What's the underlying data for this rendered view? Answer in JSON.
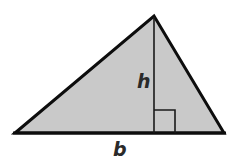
{
  "diagram": {
    "type": "geometry-triangle",
    "colors": {
      "fill": "#c9c9c9",
      "stroke": "#0d0d0d",
      "label": "#2a2a2a",
      "background": "#ffffff"
    },
    "vertices": {
      "apex": [
        154,
        16
      ],
      "bottom_left": [
        15,
        133
      ],
      "bottom_right": [
        224,
        133
      ]
    },
    "altitude": {
      "label": "h",
      "x": 154,
      "from_y": 16,
      "to_y": 133
    },
    "base": {
      "label": "b"
    },
    "right_angle_marker": {
      "x": 154,
      "y": 110,
      "size": 21
    }
  }
}
